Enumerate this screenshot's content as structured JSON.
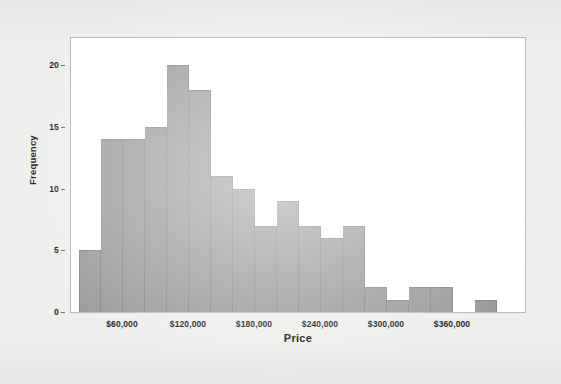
{
  "chart_data": {
    "type": "bar",
    "chart_subtype": "histogram",
    "title": "",
    "xlabel": "Price",
    "ylabel": "Frequency",
    "xlim": [
      20000,
      400000
    ],
    "ylim": [
      0,
      21
    ],
    "bin_width": 20000,
    "grid": false,
    "legend": null,
    "bar_color": "#9c9c9c",
    "bar_edge_color": "#8a8a8a",
    "plot_background": "#ffffff",
    "page_background": "#eeeeec",
    "categories": [
      "20,000-40,000",
      "40,000-60,000",
      "60,000-80,000",
      "80,000-100,000",
      "100,000-120,000",
      "120,000-140,000",
      "140,000-160,000",
      "160,000-180,000",
      "180,000-200,000",
      "200,000-220,000",
      "220,000-240,000",
      "240,000-260,000",
      "260,000-280,000",
      "280,000-300,000",
      "300,000-320,000",
      "320,000-340,000",
      "340,000-360,000",
      "360,000-380,000",
      "380,000-400,000"
    ],
    "values": [
      5,
      14,
      14,
      15,
      20,
      18,
      11,
      10,
      7,
      9,
      7,
      6,
      7,
      2,
      1,
      2,
      2,
      0,
      1
    ],
    "x_ticks": [
      {
        "value": 60000,
        "label": "$60,000"
      },
      {
        "value": 120000,
        "label": "$120,000"
      },
      {
        "value": 180000,
        "label": "$180,000"
      },
      {
        "value": 240000,
        "label": "$240,000"
      },
      {
        "value": 300000,
        "label": "$300,000"
      },
      {
        "value": 360000,
        "label": "$360,000"
      }
    ],
    "y_ticks": [
      {
        "value": 0,
        "label": "0"
      },
      {
        "value": 5,
        "label": "5"
      },
      {
        "value": 10,
        "label": "10"
      },
      {
        "value": 15,
        "label": "15"
      },
      {
        "value": 20,
        "label": "20"
      }
    ]
  }
}
